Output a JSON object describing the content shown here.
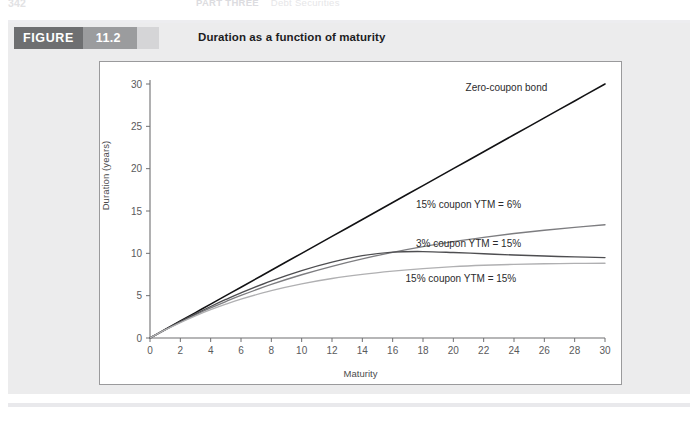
{
  "running_head": {
    "folio": "342",
    "part_label": "PART THREE",
    "section_label": "Debt Securities"
  },
  "figure": {
    "banner_word": "FIGURE",
    "number": "11.2",
    "title": "Duration as a function of maturity",
    "banner_dark_color": "#6e6f71",
    "banner_mid_color": "#9b9c9e",
    "panel_color": "#ececed"
  },
  "chart_data": {
    "type": "line",
    "title": "Duration as a function of maturity",
    "xlabel": "Maturity",
    "ylabel": "Duration (years)",
    "xlim": [
      0,
      30
    ],
    "ylim": [
      0,
      30
    ],
    "xticks": [
      0,
      2,
      4,
      6,
      8,
      10,
      12,
      14,
      16,
      18,
      20,
      22,
      24,
      26,
      28,
      30
    ],
    "yticks": [
      0,
      5,
      10,
      15,
      20,
      25,
      30
    ],
    "grid": false,
    "legend_position": "inline-annotations",
    "x": [
      0,
      1,
      2,
      3,
      4,
      5,
      6,
      8,
      10,
      12,
      14,
      16,
      18,
      20,
      22,
      24,
      26,
      28,
      30
    ],
    "series": [
      {
        "name": "Zero-coupon bond",
        "color": "#121214",
        "label_x": 23.5,
        "label_y": 29.2,
        "values": [
          0,
          1,
          2,
          3,
          4,
          5,
          6,
          8,
          10,
          12,
          14,
          16,
          18,
          20,
          22,
          24,
          26,
          28,
          30
        ]
      },
      {
        "name": "15% coupon YTM = 6%",
        "color": "#7d7d80",
        "label_x": 21.0,
        "label_y": 15.3,
        "values": [
          0,
          0.97,
          1.88,
          2.74,
          3.55,
          4.31,
          5.03,
          6.33,
          7.47,
          8.47,
          9.35,
          10.12,
          10.79,
          11.38,
          11.89,
          12.34,
          12.73,
          13.07,
          13.38
        ]
      },
      {
        "name": "3% coupon YTM = 15%",
        "color": "#4e4e51",
        "label_x": 21.0,
        "label_y": 10.7,
        "values": [
          0,
          0.99,
          1.94,
          2.85,
          3.72,
          4.55,
          5.33,
          6.75,
          7.97,
          8.97,
          9.72,
          10.14,
          10.21,
          10.1,
          9.95,
          9.8,
          9.68,
          9.58,
          9.5
        ]
      },
      {
        "name": "15% coupon YTM = 15%",
        "color": "#b0b0b2",
        "label_x": 20.5,
        "label_y": 6.6,
        "values": [
          0,
          0.95,
          1.82,
          2.62,
          3.34,
          4.0,
          4.59,
          5.6,
          6.4,
          7.03,
          7.52,
          7.9,
          8.2,
          8.43,
          8.59,
          8.7,
          8.77,
          8.81,
          8.83
        ]
      }
    ]
  }
}
